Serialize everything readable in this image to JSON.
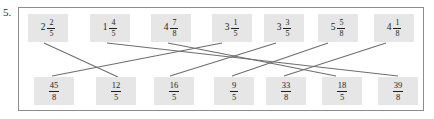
{
  "exercise": {
    "number_label": "5.",
    "instruction_type": "match-mixed-numbers-to-improper-fractions",
    "frame": {
      "border_color": "#8d8d8d",
      "background": "#ffffff"
    },
    "tile_style": {
      "fill": "#e6e6e6",
      "text_color": "#1d1d1d"
    },
    "line_color": "#6e6e6e"
  },
  "top_row": {
    "label": "mixed-numbers",
    "tiles": [
      {
        "id": "t1",
        "text": "2 2/5",
        "whole": "2",
        "numerator": "2",
        "denominator": "5",
        "x": 28
      },
      {
        "id": "t2",
        "text": "1 4/5",
        "whole": "1",
        "numerator": "4",
        "denominator": "5",
        "x": 90
      },
      {
        "id": "t3",
        "text": "4 7/8",
        "whole": "4",
        "numerator": "7",
        "denominator": "8",
        "x": 151
      },
      {
        "id": "t4",
        "text": "3 1/5",
        "whole": "3",
        "numerator": "1",
        "denominator": "5",
        "x": 212
      },
      {
        "id": "t5",
        "text": "3 3/5",
        "whole": "3",
        "numerator": "3",
        "denominator": "5",
        "x": 264
      },
      {
        "id": "t6",
        "text": "5 5/8",
        "whole": "5",
        "numerator": "5",
        "denominator": "8",
        "x": 318
      },
      {
        "id": "t7",
        "text": "4 1/8",
        "whole": "4",
        "numerator": "1",
        "denominator": "8",
        "x": 374
      }
    ]
  },
  "bottom_row": {
    "label": "improper-fractions",
    "tiles": [
      {
        "id": "b1",
        "text": "45/8",
        "numerator": "45",
        "denominator": "8",
        "x": 34
      },
      {
        "id": "b2",
        "text": "12/5",
        "numerator": "12",
        "denominator": "5",
        "x": 96
      },
      {
        "id": "b3",
        "text": "16/5",
        "numerator": "16",
        "denominator": "5",
        "x": 154
      },
      {
        "id": "b4",
        "text": "9/5",
        "numerator": "9",
        "denominator": "5",
        "x": 214
      },
      {
        "id": "b5",
        "text": "33/8",
        "numerator": "33",
        "denominator": "8",
        "x": 266
      },
      {
        "id": "b6",
        "text": "18/5",
        "numerator": "18",
        "denominator": "5",
        "x": 322
      },
      {
        "id": "b7",
        "text": "39/8",
        "numerator": "39",
        "denominator": "8",
        "x": 378
      }
    ]
  },
  "connections": [
    {
      "from": "t1",
      "to": "b2",
      "x1": 44,
      "y1": 43,
      "x2": 118,
      "y2": 77
    },
    {
      "from": "t2",
      "to": "b7",
      "x1": 107,
      "y1": 43,
      "x2": 398,
      "y2": 76
    },
    {
      "from": "t3",
      "to": "b6",
      "x1": 168,
      "y1": 43,
      "x2": 336,
      "y2": 76
    },
    {
      "from": "t4",
      "to": "b1",
      "x1": 222,
      "y1": 43,
      "x2": 52,
      "y2": 76
    },
    {
      "from": "t5",
      "to": "b3",
      "x1": 276,
      "y1": 43,
      "x2": 170,
      "y2": 76
    },
    {
      "from": "t6",
      "to": "b4",
      "x1": 328,
      "y1": 43,
      "x2": 232,
      "y2": 76
    },
    {
      "from": "t7",
      "to": "b5",
      "x1": 386,
      "y1": 43,
      "x2": 284,
      "y2": 76
    }
  ]
}
